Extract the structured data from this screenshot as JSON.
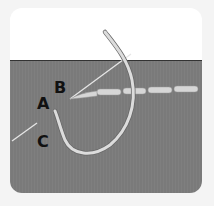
{
  "diagram": {
    "type": "embroidery-stitch-illustration",
    "labels": {
      "a": "A",
      "b": "B",
      "c": "C"
    },
    "colors": {
      "background": "#f4f4f4",
      "card_top": "#ffffff",
      "fabric": "#7a7a7a",
      "thread": "#d9d9d9",
      "label": "#111111"
    }
  }
}
